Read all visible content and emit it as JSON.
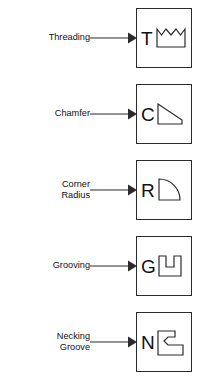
{
  "diagram": {
    "style": {
      "line_color": "#2b2b2b",
      "text_color": "#111111",
      "background": "#ffffff",
      "box_fill": "#ffffff"
    },
    "rows": [
      {
        "id": "threading",
        "label_lines": [
          "Threading"
        ],
        "letter": "T",
        "symbol_name": "threading-zigzag-symbol",
        "symbol_description": "rectangle with zigzag saw-tooth top edge"
      },
      {
        "id": "chamfer",
        "label_lines": [
          "Chamfer"
        ],
        "letter": "C",
        "symbol_name": "chamfer-bevel-symbol",
        "symbol_description": "trapezoid with diagonal bevel from top-left to right"
      },
      {
        "id": "corner-radius",
        "label_lines": [
          "Corner",
          "Radius"
        ],
        "letter": "R",
        "symbol_name": "corner-radius-arc-symbol",
        "symbol_description": "quarter round with convex arc on upper right"
      },
      {
        "id": "grooving",
        "label_lines": [
          "Grooving"
        ],
        "letter": "G",
        "symbol_name": "grooving-u-slot-symbol",
        "symbol_description": "U shape with rectangular notch cut into top centre"
      },
      {
        "id": "necking-groove",
        "label_lines": [
          "Necking",
          "Groove"
        ],
        "letter": "N",
        "symbol_name": "necking-groove-step-symbol",
        "symbol_description": "stepped polygon with angled V notch on left side"
      }
    ],
    "connector": {
      "name": "leader-arrow",
      "description": "horizontal leader line with solid triangular arrowhead pointing right"
    }
  }
}
